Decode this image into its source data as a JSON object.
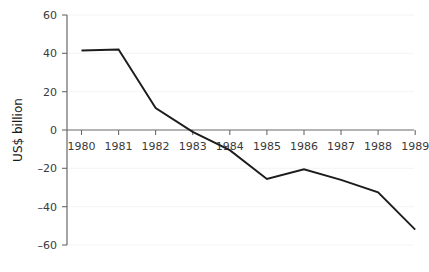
{
  "chart_data": {
    "type": "line",
    "title": "",
    "subtitle": "",
    "xlabel": "",
    "ylabel": "US$ billion",
    "categories": [
      "1980",
      "1981",
      "1982",
      "1983",
      "1984",
      "1985",
      "1986",
      "1987",
      "1988",
      "1989"
    ],
    "x": [
      1980,
      1981,
      1982,
      1983,
      1984,
      1985,
      1986,
      1987,
      1988,
      1989
    ],
    "series": [
      {
        "name": "US$ billion",
        "values": [
          41.5,
          42,
          11.5,
          -1,
          -10.5,
          -25.5,
          -20.5,
          -26,
          -32.5,
          -52
        ],
        "color": "#1c1c1c"
      }
    ],
    "ylim": [
      -60,
      60
    ],
    "yticks": [
      60,
      40,
      20,
      0,
      -20,
      -40,
      -60
    ],
    "ytick_labels": [
      "60",
      "40",
      "20",
      "0",
      "–20",
      "–40",
      "–60"
    ],
    "xtick_labels": [
      "1980",
      "1981",
      "1982",
      "1983",
      "1984",
      "1985",
      "1986",
      "1987",
      "1988",
      "1989"
    ],
    "grid": "faint-horizontal",
    "legend": "none",
    "annotations": [],
    "axis_color": "#5a5a5a",
    "text_color": "#3a3a3a"
  }
}
